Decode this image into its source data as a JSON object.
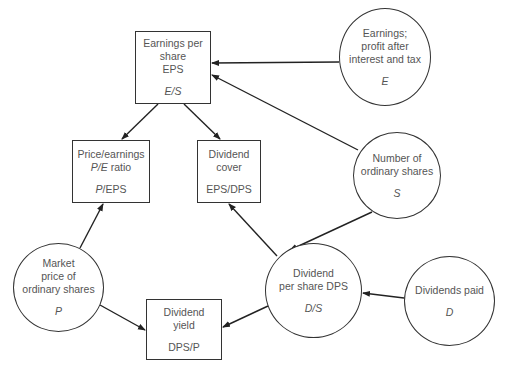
{
  "nodes": {
    "eps": {
      "shape": "box",
      "lines": [
        "Earnings per",
        "share",
        "EPS"
      ],
      "formula": "E/S"
    },
    "pe": {
      "shape": "box",
      "line1": "Price/earnings",
      "line2_italic": "P/E",
      "line2_rest": " ratio",
      "formula_italic": "P",
      "formula_rest": "/EPS"
    },
    "cover": {
      "shape": "box",
      "lines": [
        "Dividend",
        "cover"
      ],
      "formula": "EPS/DPS"
    },
    "yield": {
      "shape": "box",
      "lines": [
        "Dividend",
        "yield"
      ],
      "formula": "DPS/P"
    },
    "earnings": {
      "shape": "circle",
      "lines": [
        "Earnings;",
        "profit after",
        "interest and tax"
      ],
      "symbol": "E"
    },
    "shares": {
      "shape": "circle",
      "lines": [
        "Number of",
        "ordinary shares"
      ],
      "symbol": "S"
    },
    "dps": {
      "shape": "circle",
      "lines": [
        "Dividend",
        "per share DPS"
      ],
      "symbol": "D/S"
    },
    "price": {
      "shape": "circle",
      "lines": [
        "Market",
        "price of",
        "ordinary shares"
      ],
      "symbol": "P"
    },
    "dividends": {
      "shape": "circle",
      "lines": [
        "Dividends paid"
      ],
      "symbol": "D"
    }
  },
  "edges": [
    {
      "from": "earnings",
      "to": "eps"
    },
    {
      "from": "shares",
      "to": "eps"
    },
    {
      "from": "shares",
      "to": "dps"
    },
    {
      "from": "eps",
      "to": "pe"
    },
    {
      "from": "eps",
      "to": "cover"
    },
    {
      "from": "dps",
      "to": "cover"
    },
    {
      "from": "dps",
      "to": "yield"
    },
    {
      "from": "price",
      "to": "pe"
    },
    {
      "from": "price",
      "to": "yield"
    },
    {
      "from": "dividends",
      "to": "dps"
    }
  ],
  "colors": {
    "line": "#222222",
    "text": "#555555",
    "background": "#ffffff"
  }
}
